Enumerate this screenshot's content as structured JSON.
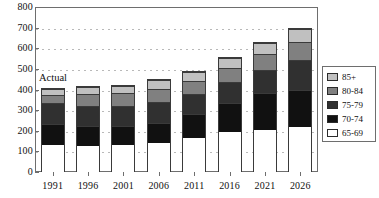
{
  "chart_data": {
    "type": "bar",
    "stacked": true,
    "title": "",
    "xlabel": "",
    "ylabel": "",
    "categories": [
      "1991",
      "1996",
      "2001",
      "2006",
      "2011",
      "2016",
      "2021",
      "2026"
    ],
    "series": [
      {
        "name": "65-69",
        "color": "#ffffff",
        "values": [
          133,
          128,
          131,
          141,
          165,
          196,
          205,
          220
        ]
      },
      {
        "name": "70-74",
        "color": "#111111",
        "values": [
          104,
          100,
          97,
          100,
          117,
          140,
          180,
          180
        ]
      },
      {
        "name": "75-79",
        "color": "#303030",
        "values": [
          100,
          97,
          97,
          100,
          100,
          102,
          112,
          145
        ]
      },
      {
        "name": "80-84",
        "color": "#808080",
        "values": [
          43,
          60,
          63,
          67,
          65,
          70,
          80,
          90
        ]
      },
      {
        "name": "85+",
        "color": "#c0c0c0",
        "values": [
          25,
          32,
          34,
          41,
          43,
          52,
          53,
          65
        ]
      }
    ],
    "totals": [
      405,
      417,
      422,
      449,
      490,
      560,
      630,
      700
    ],
    "ylim": [
      0,
      800
    ],
    "yticks": [
      0,
      100,
      200,
      300,
      400,
      500,
      600,
      700,
      800
    ],
    "ytick_labels": [
      "0",
      "100",
      "200",
      "300",
      "400",
      "500",
      "600",
      "700",
      "800"
    ],
    "grid": true,
    "grid_style": "dotted",
    "legend_position": "right",
    "legend_entries": [
      {
        "label": "85+",
        "color": "#c0c0c0"
      },
      {
        "label": "80-84",
        "color": "#808080"
      },
      {
        "label": "75-79",
        "color": "#303030"
      },
      {
        "label": "70-74",
        "color": "#111111"
      },
      {
        "label": "65-69",
        "color": "#ffffff"
      }
    ],
    "annotations": [
      {
        "text": "Actual",
        "x": "1991",
        "y": 460
      }
    ]
  }
}
